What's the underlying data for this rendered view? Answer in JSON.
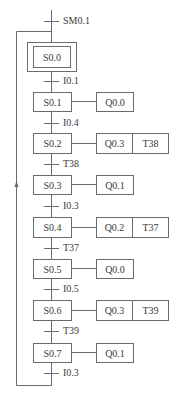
{
  "diagram": {
    "type": "sequential-function-chart",
    "initial_transition": "SM0.1",
    "initial_step": "S0.0",
    "steps": [
      {
        "name": "S0.1",
        "actions": [
          "Q0.0"
        ]
      },
      {
        "name": "S0.2",
        "actions": [
          "Q0.3",
          "T38"
        ]
      },
      {
        "name": "S0.3",
        "actions": [
          "Q0.1"
        ]
      },
      {
        "name": "S0.4",
        "actions": [
          "Q0.2",
          "T37"
        ]
      },
      {
        "name": "S0.5",
        "actions": [
          "Q0.0"
        ]
      },
      {
        "name": "S0.6",
        "actions": [
          "Q0.3",
          "T39"
        ]
      },
      {
        "name": "S0.7",
        "actions": [
          "Q0.1"
        ]
      }
    ],
    "transitions": [
      "I0.1",
      "I0.4",
      "T38",
      "I0.3",
      "T37",
      "I0.5",
      "T39",
      "I0.3"
    ],
    "line_color": "#6a6a6a",
    "text_color": "#3a3a3a"
  }
}
